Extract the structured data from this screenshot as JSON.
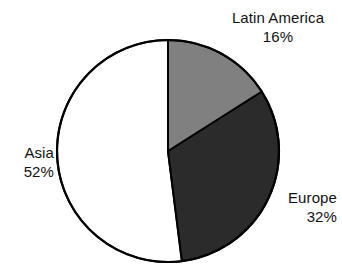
{
  "chart_data": {
    "type": "pie",
    "title": "",
    "subtitle": "",
    "xlabel": "",
    "ylabel": "",
    "legend_position": "none",
    "grid": false,
    "unit": "%",
    "start_angle_deg": 0,
    "direction": "clockwise",
    "categories": [
      "Latin America",
      "Europe",
      "Asia"
    ],
    "values": [
      16,
      32,
      52
    ],
    "slices": [
      {
        "label": "Latin America",
        "value": 16,
        "value_text": "16%",
        "color": "#808080",
        "start_deg": 0,
        "end_deg": 57.6,
        "label_position": "top-right"
      },
      {
        "label": "Europe",
        "value": 32,
        "value_text": "32%",
        "color": "#2b2b2b",
        "start_deg": 57.6,
        "end_deg": 172.8,
        "label_position": "right"
      },
      {
        "label": "Asia",
        "value": 52,
        "value_text": "52%",
        "color": "#ffffff",
        "start_deg": 172.8,
        "end_deg": 360,
        "label_position": "left"
      }
    ]
  },
  "figure": {
    "background_color": "#ffffff",
    "outline_color": "#000000",
    "text_color": "#111111"
  },
  "labels": {
    "latin_america": {
      "name": "Latin America",
      "value": "16%"
    },
    "europe": {
      "name": "Europe",
      "value": "32%"
    },
    "asia": {
      "name": "Asia",
      "value": "52%"
    }
  }
}
